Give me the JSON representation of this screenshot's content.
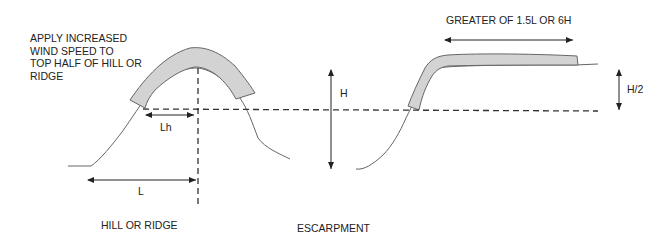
{
  "annotation": {
    "text": "APPLY INCREASED\nWIND SPEED TO\nTOP HALF OF HILL OR\nRIDGE"
  },
  "hill": {
    "caption": "HILL OR RIDGE",
    "dim_lh": "Lh",
    "dim_l": "L"
  },
  "escarpment": {
    "caption": "ESCARPMENT",
    "dim_top": "GREATER OF 1.5L OR 6H",
    "dim_half": "H/2"
  },
  "shared": {
    "dim_h": "H"
  },
  "colors": {
    "shading": "#d3d3d3",
    "line": "#555555",
    "dash": "#333333"
  }
}
